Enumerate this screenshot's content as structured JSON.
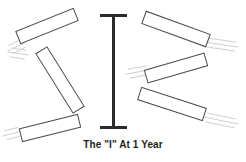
{
  "figure": {
    "caption": "The \"I\" At 1 Year",
    "colors": {
      "background": "#ffffff",
      "bar_stroke": "#4a4a4a",
      "bar_fill": "#ffffff",
      "beam_fill": "#2b2b2b",
      "motion_line": "#cfcfcf",
      "caption_text": "#231f20"
    },
    "center_beam": {
      "name": "letter-i-beam",
      "label": "I",
      "x": 113.5,
      "top_y": 14,
      "bottom_y": 126,
      "stem_width": 3,
      "serif_width": 27,
      "serif_height": 3
    },
    "bars": [
      {
        "id": "bar-top-left",
        "cx": 47,
        "cy": 26,
        "length": 62,
        "thickness": 13,
        "angle": -22
      },
      {
        "id": "bar-middle-left",
        "cx": 60,
        "cy": 80,
        "length": 70,
        "thickness": 13,
        "angle": 58
      },
      {
        "id": "bar-bottom-left",
        "cx": 50,
        "cy": 128,
        "length": 60,
        "thickness": 13,
        "angle": -14
      },
      {
        "id": "bar-top-right",
        "cx": 176,
        "cy": 29,
        "length": 68,
        "thickness": 13,
        "angle": 20
      },
      {
        "id": "bar-middle-right",
        "cx": 176,
        "cy": 68,
        "length": 62,
        "thickness": 13,
        "angle": -16
      },
      {
        "id": "bar-bottom-right",
        "cx": 172,
        "cy": 104,
        "length": 68,
        "thickness": 13,
        "angle": 18
      }
    ],
    "motion_lines": [
      {
        "id": "motion-top-left",
        "x1": 8,
        "y1": 51,
        "x2": 26,
        "y2": 42,
        "count": 3,
        "angle": -22
      },
      {
        "id": "motion-middle-left",
        "x1": 8,
        "y1": 52,
        "x2": 28,
        "y2": 55,
        "count": 3,
        "angle": 10
      },
      {
        "id": "motion-bottom-left",
        "x1": 3,
        "y1": 136,
        "x2": 22,
        "y2": 131,
        "count": 3,
        "angle": -14
      },
      {
        "id": "motion-top-right",
        "x1": 204,
        "y1": 42,
        "x2": 238,
        "y2": 47,
        "count": 3,
        "angle": 12
      },
      {
        "id": "motion-middle-right",
        "x1": 126,
        "y1": 74,
        "x2": 150,
        "y2": 70,
        "count": 3,
        "angle": -10
      },
      {
        "id": "motion-bottom-right",
        "x1": 204,
        "y1": 117,
        "x2": 238,
        "y2": 124,
        "count": 3,
        "angle": 15
      }
    ],
    "caption_position": {
      "x": 123,
      "y": 148
    }
  }
}
